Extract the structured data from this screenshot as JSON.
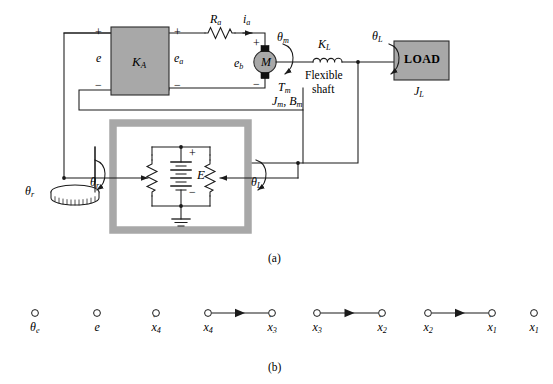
{
  "figure": {
    "caption_a": "(a)",
    "caption_b": "(b)"
  },
  "diagram_a": {
    "blocks": [
      {
        "name": "amplifier",
        "label": "K",
        "sub": "A",
        "fill": "#a8a8a8"
      },
      {
        "name": "motor",
        "label": "M",
        "fill": "#a8a8a8"
      },
      {
        "name": "load",
        "label": "LOAD",
        "sub_label": "J",
        "sub_label_sub": "L",
        "fill": "#a8a8a8"
      }
    ],
    "labels": {
      "error_voltage": "e",
      "armature_voltage": "e",
      "armature_voltage_sub": "a",
      "back_emf": "e",
      "back_emf_sub": "b",
      "armature_resistance": "R",
      "armature_resistance_sub": "a",
      "armature_current": "i",
      "armature_current_sub": "a",
      "motor_angle": "θ",
      "motor_angle_sub": "m",
      "motor_torque": "T",
      "motor_torque_sub": "m",
      "motor_inertia_damping": "J",
      "motor_inertia_damping_sub": "m",
      "motor_inertia_damping_tail": ", B",
      "motor_inertia_damping_tail_sub": "m",
      "shaft_stiffness": "K",
      "shaft_stiffness_sub": "L",
      "flexible_shaft_line1": "Flexible",
      "flexible_shaft_line2": "shaft",
      "load_angle": "θ",
      "load_angle_sub": "L",
      "load_inertia": "J",
      "load_inertia_sub": "L",
      "reference_angle": "θ",
      "reference_angle_sub": "r",
      "battery": "E",
      "plus": "+",
      "minus": "−"
    },
    "potentiometer": {
      "name": "error-detector-potentiometer",
      "frame_fill": "#a8a8a8",
      "inner_fill": "#ffffff",
      "left_wiper_label": "θ",
      "left_wiper_sub": "r",
      "right_wiper_label": "θ",
      "right_wiper_sub": "L",
      "source_label": "E"
    },
    "knob": {
      "name": "reference-input-knob",
      "label": "θ",
      "sub": "r"
    }
  },
  "chart_data": {
    "type": "diagram",
    "nodes": [
      {
        "id": "n1",
        "label": "θ",
        "sub": "e",
        "dot": false,
        "cx": 35,
        "cy": 313
      },
      {
        "id": "n2",
        "label": "e",
        "sub": "",
        "dot": false,
        "cx": 97,
        "cy": 313
      },
      {
        "id": "n3",
        "label": "x",
        "sub": "4",
        "dot": true,
        "cx": 156,
        "cy": 313
      },
      {
        "id": "n4",
        "label": "x",
        "sub": "4",
        "dot": false,
        "cx": 208,
        "cy": 313
      },
      {
        "id": "n5",
        "label": "x",
        "sub": "3",
        "dot": true,
        "cx": 272,
        "cy": 313
      },
      {
        "id": "n6",
        "label": "x",
        "sub": "3",
        "dot": false,
        "cx": 317,
        "cy": 313
      },
      {
        "id": "n7",
        "label": "x",
        "sub": "2",
        "dot": true,
        "cx": 382,
        "cy": 313
      },
      {
        "id": "n8",
        "label": "x",
        "sub": "2",
        "dot": false,
        "cx": 428,
        "cy": 313
      },
      {
        "id": "n9",
        "label": "x",
        "sub": "1",
        "dot": true,
        "cx": 492,
        "cy": 313
      },
      {
        "id": "n10",
        "label": "x",
        "sub": "1",
        "dot": false,
        "cx": 534,
        "cy": 313
      }
    ],
    "edges": [
      {
        "from": "n4",
        "to": "n5"
      },
      {
        "from": "n6",
        "to": "n7"
      },
      {
        "from": "n8",
        "to": "n9"
      }
    ],
    "node_radius": 3.4,
    "stroke": "#1a1a1a"
  },
  "colors": {
    "block_fill": "#a8a8a8",
    "block_stroke": "#2b2b2b",
    "wire": "#1a1a1a",
    "background": "#ffffff"
  }
}
